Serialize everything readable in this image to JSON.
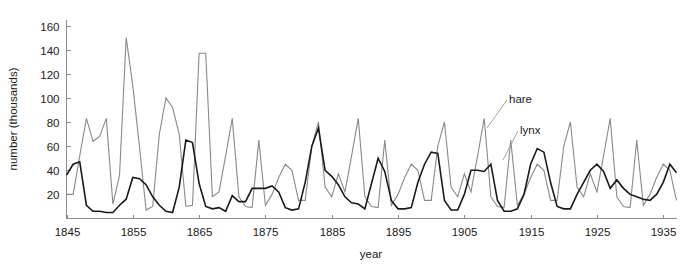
{
  "figure": {
    "background_color": "#ffffff",
    "width": 682,
    "height": 268
  },
  "chart_data": {
    "type": "line",
    "title": "",
    "xlabel": "year",
    "ylabel": "number (thousands)",
    "xlim": [
      1845,
      1937
    ],
    "ylim": [
      0,
      165
    ],
    "xticks": [
      1845,
      1855,
      1865,
      1875,
      1885,
      1895,
      1905,
      1915,
      1925,
      1935
    ],
    "yticks": [
      20,
      40,
      60,
      80,
      100,
      120,
      140,
      160
    ],
    "grid": false,
    "legend_position": "inline-annotation",
    "x": [
      1845,
      1846,
      1847,
      1848,
      1849,
      1850,
      1851,
      1852,
      1853,
      1854,
      1855,
      1856,
      1857,
      1858,
      1859,
      1860,
      1861,
      1862,
      1863,
      1864,
      1865,
      1866,
      1867,
      1868,
      1869,
      1870,
      1871,
      1872,
      1873,
      1874,
      1875,
      1876,
      1877,
      1878,
      1879,
      1880,
      1881,
      1882,
      1883,
      1884,
      1885,
      1886,
      1887,
      1888,
      1889,
      1890,
      1891,
      1892,
      1893,
      1894,
      1895,
      1896,
      1897,
      1898,
      1899,
      1900,
      1901,
      1902,
      1903,
      1904,
      1905,
      1906,
      1907,
      1908,
      1909,
      1910,
      1911,
      1912,
      1913,
      1914,
      1915,
      1916,
      1917,
      1918,
      1919,
      1920,
      1921,
      1922,
      1923,
      1924,
      1925,
      1926,
      1927,
      1928,
      1929,
      1930,
      1931,
      1932,
      1933,
      1934,
      1935,
      1936,
      1937
    ],
    "series": [
      {
        "name": "hare",
        "color": "#8a8a8a",
        "line_width": 1.1,
        "label_text": "hare",
        "values": [
          20,
          20,
          52,
          83,
          64,
          68,
          83,
          12,
          36,
          150,
          110,
          60,
          7,
          10,
          70,
          100,
          92,
          70,
          10,
          11,
          137,
          137,
          18,
          22,
          52,
          83,
          18,
          10,
          9,
          65,
          11,
          20,
          34,
          45,
          40,
          15,
          15,
          60,
          80,
          26,
          18,
          37,
          22,
          52,
          83,
          18,
          10,
          9,
          65,
          11,
          20,
          34,
          45,
          40,
          15,
          15,
          60,
          80,
          26,
          18,
          37,
          22,
          52,
          83,
          18,
          10,
          9,
          65,
          11,
          20,
          34,
          45,
          40,
          15,
          15,
          60,
          80,
          26,
          18,
          37,
          22,
          52,
          83,
          18,
          10,
          9,
          65,
          11,
          20,
          34,
          45,
          40,
          15
        ]
      },
      {
        "name": "lynx",
        "color": "#1a1a1a",
        "line_width": 1.6,
        "label_text": "lynx",
        "values": [
          36,
          45,
          47,
          11,
          6,
          6,
          5,
          5,
          11,
          16,
          34,
          33,
          28,
          18,
          11,
          6,
          5,
          26,
          65,
          63,
          29,
          10,
          8,
          9,
          6,
          19,
          14,
          14,
          25,
          25,
          25,
          27,
          22,
          9,
          7,
          8,
          30,
          60,
          75,
          40,
          35,
          28,
          18,
          13,
          12,
          8,
          29,
          50,
          39,
          15,
          8,
          8,
          9,
          30,
          45,
          55,
          54,
          15,
          7,
          7,
          20,
          40,
          40,
          39,
          45,
          15,
          6,
          6,
          8,
          20,
          45,
          58,
          55,
          30,
          10,
          8,
          8,
          20,
          30,
          40,
          45,
          39,
          25,
          32,
          25,
          20,
          18,
          16,
          15,
          20,
          30,
          45,
          38
        ]
      }
    ],
    "annotations": [
      {
        "text": "hare",
        "year_near": 1913,
        "value_near": 100
      },
      {
        "text": "lynx",
        "year_near": 1916,
        "value_near": 78
      }
    ]
  },
  "axes": {
    "x_axis_title": "year",
    "y_axis_title": "number (thousands)",
    "x_tick_labels": [
      "1845",
      "1855",
      "1865",
      "1875",
      "1885",
      "1895",
      "1905",
      "1915",
      "1925",
      "1935"
    ],
    "y_tick_labels": [
      "20",
      "40",
      "60",
      "80",
      "100",
      "120",
      "140",
      "160"
    ],
    "axis_color": "#8d8d8d"
  }
}
